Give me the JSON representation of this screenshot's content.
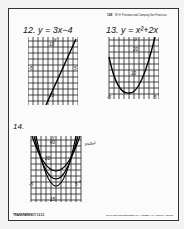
{
  "header": {
    "page_num": "128",
    "note": "W. H. Freeman and Company  San Francisco"
  },
  "problems": [
    {
      "number": "12.",
      "equation": "y = 3x−4",
      "graph": {
        "type": "line",
        "x_range": [
          -5,
          5
        ],
        "y_range": [
          -10,
          10
        ],
        "labels": [
          "y",
          "10",
          "x",
          "-5",
          "5",
          "10",
          "-10"
        ]
      }
    },
    {
      "number": "13.",
      "equation": "y = x²+2x",
      "graph": {
        "type": "parabola",
        "x_range": [
          -5,
          5
        ],
        "y_range": [
          0,
          30
        ],
        "labels": [
          "y",
          "20",
          "10",
          "x",
          "-5",
          "5",
          "0"
        ]
      }
    },
    {
      "number": "14.",
      "equation": "",
      "curve_label": "y=2x²",
      "graph": {
        "type": "parabola-family",
        "x_range": [
          -5,
          5
        ],
        "y_range": [
          -15,
          45
        ],
        "labels": [
          "y",
          "40",
          "20",
          "x",
          "-5",
          "5",
          "-15"
        ]
      }
    }
  ],
  "footer": {
    "left": "TRANSPARENCY 12-13",
    "right": "To be used with ELEMENTARY ALGEBRA by Harold R. Jacobs"
  },
  "colors": {
    "ink": "#111111",
    "paper": "#fbfbfb",
    "background": "#f4f4f4"
  }
}
